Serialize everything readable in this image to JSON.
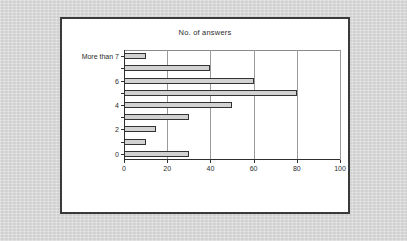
{
  "panel": {
    "title": "No. of answers",
    "background_color": "#ffffff",
    "border_color": "#3a3a3a"
  },
  "backdrop": {
    "color": "#d8d8d8"
  },
  "chart_data": {
    "type": "bar",
    "orientation": "horizontal",
    "title": "No. of answers",
    "xlabel": "",
    "ylabel": "",
    "categories": [
      "0",
      "1",
      "2",
      "3",
      "4",
      "5",
      "6",
      "7",
      "More than 7"
    ],
    "values": [
      30,
      10,
      15,
      30,
      50,
      80,
      60,
      40,
      10
    ],
    "visible_category_labels": [
      "0",
      "",
      "2",
      "",
      "4",
      "",
      "6",
      "",
      "More than 7"
    ],
    "xlim": [
      0,
      100
    ],
    "xticks": [
      0,
      20,
      40,
      60,
      80,
      100
    ],
    "xtick_labels": [
      "0",
      "20",
      "40",
      "60",
      "80",
      "100"
    ],
    "grid": "vertical",
    "legend": "none",
    "bar_fill_color": "#d2d2d2",
    "bar_edge_color": "#333333",
    "gridline_color": "#9a9a9a",
    "axis_color": "#2f2f2f"
  }
}
